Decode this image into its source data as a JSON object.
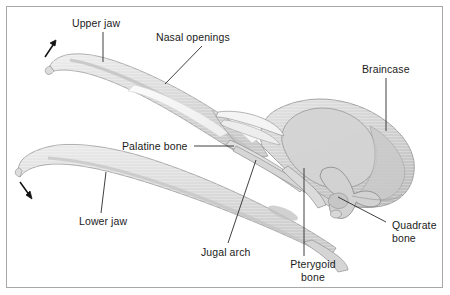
{
  "figure": {
    "background_color": "#ffffff",
    "border_color": "#a8a8a8",
    "bone_fill_light": "#f2f2f2",
    "bone_fill_mid": "#dcdcdc",
    "bone_fill_dark": "#c4c4c4",
    "outline_color": "#8a8a8a",
    "leader_line_color": "#2b2b2b",
    "label_text_color": "#1b1b1b"
  },
  "labels": [
    {
      "id": "upper-jaw",
      "text": "Upper jaw",
      "x": 72,
      "y": 17,
      "leader": {
        "type": "vertical",
        "x1": 103,
        "y1": 32,
        "x2": 103,
        "y2": 62
      }
    },
    {
      "id": "nasal-openings",
      "text": "Nasal openings",
      "x": 156,
      "y": 31,
      "leader": {
        "type": "diagonal",
        "x1": 202,
        "y1": 46,
        "x2": 165,
        "y2": 84
      }
    },
    {
      "id": "braincase",
      "text": "Braincase",
      "x": 362,
      "y": 63,
      "leader": {
        "type": "vertical",
        "x1": 386,
        "y1": 78,
        "x2": 386,
        "y2": 131
      }
    },
    {
      "id": "palatine-bone",
      "text": "Palatine bone",
      "x": 122,
      "y": 140,
      "leader": {
        "type": "horizontal",
        "x1": 194,
        "y1": 146,
        "x2": 234,
        "y2": 146
      }
    },
    {
      "id": "lower-jaw",
      "text": "Lower jaw",
      "x": 79,
      "y": 215,
      "leader": {
        "type": "diagonal",
        "x1": 101,
        "y1": 213,
        "x2": 105,
        "y2": 172
      }
    },
    {
      "id": "jugal-arch",
      "text": "Jugal arch",
      "x": 201,
      "y": 246,
      "leader": {
        "type": "diagonal",
        "x1": 228,
        "y1": 243,
        "x2": 256,
        "y2": 160
      }
    },
    {
      "id": "pterygoid-bone",
      "text": "Pterygoid bone",
      "line1": "Pterygoid",
      "line2": "bone",
      "x": 283,
      "y": 258,
      "leader": {
        "type": "vertical",
        "x1": 304,
        "y1": 256,
        "x2": 304,
        "y2": 168
      }
    },
    {
      "id": "quadrate-bone",
      "text": "Quadrate bone",
      "line1": "Quadrate",
      "line2": "bone",
      "x": 392,
      "y": 219,
      "leader": {
        "type": "diagonal",
        "x1": 386,
        "y1": 222,
        "x2": 338,
        "y2": 197
      }
    }
  ],
  "arrows": [
    {
      "id": "upper-jaw-motion-arrow",
      "direction": "up-right",
      "x1": 46,
      "y1": 56,
      "x2": 56,
      "y2": 41
    },
    {
      "id": "lower-jaw-motion-arrow",
      "direction": "down-right",
      "x1": 21,
      "y1": 183,
      "x2": 32,
      "y2": 198
    }
  ],
  "structures": [
    {
      "id": "upper-jaw",
      "name": "Upper jaw"
    },
    {
      "id": "nasal-openings",
      "name": "Nasal openings"
    },
    {
      "id": "braincase",
      "name": "Braincase"
    },
    {
      "id": "palatine-bone",
      "name": "Palatine bone"
    },
    {
      "id": "lower-jaw",
      "name": "Lower jaw"
    },
    {
      "id": "jugal-arch",
      "name": "Jugal arch"
    },
    {
      "id": "pterygoid-bone",
      "name": "Pterygoid bone"
    },
    {
      "id": "quadrate-bone",
      "name": "Quadrate bone"
    }
  ]
}
